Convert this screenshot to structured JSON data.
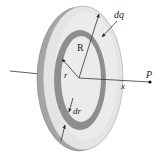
{
  "figure": {
    "labels": {
      "dq": "dq",
      "R": "R",
      "r": "r",
      "P": "P",
      "x": "x",
      "dr": "dr"
    },
    "colors": {
      "disk_face": "#e6e6e6",
      "disk_edge": "#9a9a9a",
      "ring": "#8f8f8f",
      "inner_face": "#ececec",
      "lines": "#222222"
    }
  }
}
